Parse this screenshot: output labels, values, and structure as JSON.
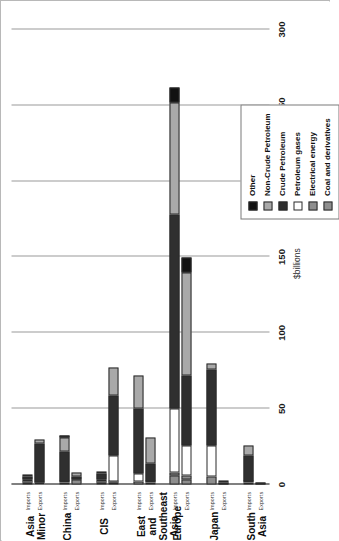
{
  "chart_data": {
    "type": "bar",
    "orientation": "vertical-stacked-rotated",
    "title": "",
    "xlabel": "",
    "ylabel": "$billions",
    "ylim": [
      0,
      300
    ],
    "yticks": [
      0,
      50,
      100,
      150,
      200,
      250,
      300
    ],
    "ytick_labels": [
      "0",
      "50",
      "100",
      "150",
      "200",
      "250",
      "300"
    ],
    "grid": true,
    "legend_position": "inside-left",
    "series": [
      {
        "name": "Other",
        "color": "#111111"
      },
      {
        "name": "Non-Crude Petroleum",
        "color": "#a9a9a9"
      },
      {
        "name": "Crude Petroleum",
        "color": "#2f2f2f"
      },
      {
        "name": "Petroleum gases",
        "color": "#ffffff"
      },
      {
        "name": "Electrical energy",
        "color": "#8e8e8e"
      },
      {
        "name": "Coal and derivatives",
        "color": "#8e8e8e"
      }
    ],
    "categories": [
      "Asia Minor",
      "China",
      "CIS",
      "East and\nSoutheast Asia",
      "Europe",
      "Japan",
      "South Asia"
    ],
    "flows": [
      "Imports",
      "Exports"
    ],
    "groups": [
      {
        "name": "Asia Minor",
        "bars": [
          {
            "flow": "Imports",
            "total": 6,
            "segments": [
              {
                "name": "Coal and derivatives",
                "value": 1
              },
              {
                "name": "Electrical energy",
                "value": 1
              },
              {
                "name": "Petroleum gases",
                "value": 1
              },
              {
                "name": "Crude Petroleum",
                "value": 2
              },
              {
                "name": "Non-Crude Petroleum",
                "value": 1
              },
              {
                "name": "Other",
                "value": 0
              }
            ]
          },
          {
            "flow": "Exports",
            "total": 30,
            "segments": [
              {
                "name": "Coal and derivatives",
                "value": 0
              },
              {
                "name": "Electrical energy",
                "value": 0
              },
              {
                "name": "Petroleum gases",
                "value": 1
              },
              {
                "name": "Crude Petroleum",
                "value": 26
              },
              {
                "name": "Non-Crude Petroleum",
                "value": 3
              },
              {
                "name": "Other",
                "value": 0
              }
            ]
          }
        ]
      },
      {
        "name": "China",
        "bars": [
          {
            "flow": "Imports",
            "total": 32,
            "segments": [
              {
                "name": "Coal and derivatives",
                "value": 1
              },
              {
                "name": "Electrical energy",
                "value": 0
              },
              {
                "name": "Petroleum gases",
                "value": 1
              },
              {
                "name": "Crude Petroleum",
                "value": 20
              },
              {
                "name": "Non-Crude Petroleum",
                "value": 9
              },
              {
                "name": "Other",
                "value": 1
              }
            ]
          },
          {
            "flow": "Exports",
            "total": 8,
            "segments": [
              {
                "name": "Coal and derivatives",
                "value": 3
              },
              {
                "name": "Electrical energy",
                "value": 0
              },
              {
                "name": "Petroleum gases",
                "value": 0
              },
              {
                "name": "Crude Petroleum",
                "value": 2
              },
              {
                "name": "Non-Crude Petroleum",
                "value": 3
              },
              {
                "name": "Other",
                "value": 0
              }
            ]
          }
        ]
      },
      {
        "name": "CIS",
        "bars": [
          {
            "flow": "Imports",
            "total": 8,
            "segments": [
              {
                "name": "Coal and derivatives",
                "value": 1
              },
              {
                "name": "Electrical energy",
                "value": 1
              },
              {
                "name": "Petroleum gases",
                "value": 1
              },
              {
                "name": "Crude Petroleum",
                "value": 4
              },
              {
                "name": "Non-Crude Petroleum",
                "value": 1
              },
              {
                "name": "Other",
                "value": 0
              }
            ]
          },
          {
            "flow": "Exports",
            "total": 77,
            "segments": [
              {
                "name": "Coal and derivatives",
                "value": 1
              },
              {
                "name": "Electrical energy",
                "value": 1
              },
              {
                "name": "Petroleum gases",
                "value": 17
              },
              {
                "name": "Crude Petroleum",
                "value": 40
              },
              {
                "name": "Non-Crude Petroleum",
                "value": 18
              },
              {
                "name": "Other",
                "value": 0
              }
            ]
          }
        ]
      },
      {
        "name": "East and\nSoutheast Asia",
        "bars": [
          {
            "flow": "Imports",
            "total": 72,
            "segments": [
              {
                "name": "Coal and derivatives",
                "value": 2
              },
              {
                "name": "Electrical energy",
                "value": 0
              },
              {
                "name": "Petroleum gases",
                "value": 5
              },
              {
                "name": "Crude Petroleum",
                "value": 43
              },
              {
                "name": "Non-Crude Petroleum",
                "value": 22
              },
              {
                "name": "Other",
                "value": 0
              }
            ]
          },
          {
            "flow": "Exports",
            "total": 31,
            "segments": [
              {
                "name": "Coal and derivatives",
                "value": 1
              },
              {
                "name": "Electrical energy",
                "value": 0
              },
              {
                "name": "Petroleum gases",
                "value": 1
              },
              {
                "name": "Crude Petroleum",
                "value": 12
              },
              {
                "name": "Non-Crude Petroleum",
                "value": 17
              },
              {
                "name": "Other",
                "value": 0
              }
            ]
          }
        ]
      },
      {
        "name": "Europe",
        "bars": [
          {
            "flow": "Imports",
            "total": 262,
            "segments": [
              {
                "name": "Coal and derivatives",
                "value": 6
              },
              {
                "name": "Electrical energy",
                "value": 2
              },
              {
                "name": "Petroleum gases",
                "value": 42
              },
              {
                "name": "Crude Petroleum",
                "value": 128
              },
              {
                "name": "Non-Crude Petroleum",
                "value": 74
              },
              {
                "name": "Other",
                "value": 10
              }
            ]
          },
          {
            "flow": "Exports",
            "total": 150,
            "segments": [
              {
                "name": "Coal and derivatives",
                "value": 3
              },
              {
                "name": "Electrical energy",
                "value": 3
              },
              {
                "name": "Petroleum gases",
                "value": 20
              },
              {
                "name": "Crude Petroleum",
                "value": 46
              },
              {
                "name": "Non-Crude Petroleum",
                "value": 68
              },
              {
                "name": "Other",
                "value": 10
              }
            ]
          }
        ]
      },
      {
        "name": "Japan",
        "bars": [
          {
            "flow": "Imports",
            "total": 80,
            "segments": [
              {
                "name": "Coal and derivatives",
                "value": 5
              },
              {
                "name": "Electrical energy",
                "value": 0
              },
              {
                "name": "Petroleum gases",
                "value": 21
              },
              {
                "name": "Crude Petroleum",
                "value": 50
              },
              {
                "name": "Non-Crude Petroleum",
                "value": 4
              },
              {
                "name": "Other",
                "value": 0
              }
            ]
          },
          {
            "flow": "Exports",
            "total": 2,
            "segments": [
              {
                "name": "Coal and derivatives",
                "value": 0
              },
              {
                "name": "Electrical energy",
                "value": 0
              },
              {
                "name": "Petroleum gases",
                "value": 0
              },
              {
                "name": "Crude Petroleum",
                "value": 1
              },
              {
                "name": "Non-Crude Petroleum",
                "value": 1
              },
              {
                "name": "Other",
                "value": 0
              }
            ]
          }
        ]
      },
      {
        "name": "South Asia",
        "bars": [
          {
            "flow": "Imports",
            "total": 26,
            "segments": [
              {
                "name": "Coal and derivatives",
                "value": 1
              },
              {
                "name": "Electrical energy",
                "value": 0
              },
              {
                "name": "Petroleum gases",
                "value": 1
              },
              {
                "name": "Crude Petroleum",
                "value": 17
              },
              {
                "name": "Non-Crude Petroleum",
                "value": 7
              },
              {
                "name": "Other",
                "value": 0
              }
            ]
          },
          {
            "flow": "Exports",
            "total": 1,
            "segments": [
              {
                "name": "Coal and derivatives",
                "value": 0
              },
              {
                "name": "Electrical energy",
                "value": 0
              },
              {
                "name": "Petroleum gases",
                "value": 0
              },
              {
                "name": "Crude Petroleum",
                "value": 1
              },
              {
                "name": "Non-Crude Petroleum",
                "value": 0
              },
              {
                "name": "Other",
                "value": 0
              }
            ]
          }
        ]
      }
    ]
  }
}
